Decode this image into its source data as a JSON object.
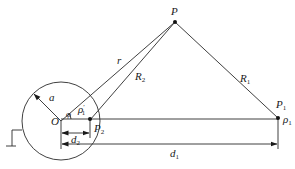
{
  "diagram": {
    "points": {
      "P": "P",
      "O": "O",
      "P1": "P",
      "P1_sub": "1",
      "P2": "P",
      "P2_sub": "2",
      "rho1": "ρ",
      "rho1_sub": "1",
      "rho1_prime": "ρ",
      "rho1_prime_sup": "′",
      "rho1_prime_sub": "1"
    },
    "segments": {
      "r": "r",
      "R1": "R",
      "R1_sub": "1",
      "R2": "R",
      "R2_sub": "2",
      "a": "a"
    },
    "angles": {
      "phi": "φ"
    },
    "dimensions": {
      "d1": "d",
      "d1_sub": "1",
      "d2": "d",
      "d2_sub": "2"
    },
    "symbols": {
      "ground": "ground-symbol"
    }
  }
}
